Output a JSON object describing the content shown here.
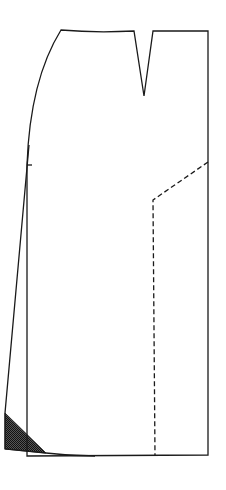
{
  "diagram": {
    "type": "skirt-pattern-piece",
    "colors": {
      "line": "#1a1a1a",
      "background": "#ffffff",
      "shading": "#333333"
    },
    "elements": {
      "outline": "skirt-pattern-outline",
      "dart": "waist-dart",
      "hip_notch": "hip-notch",
      "flare_line": "side-seam-flare-line",
      "style_line": "dashed-style-line",
      "shaded_area": "hem-flare-shaded-wedge"
    }
  }
}
